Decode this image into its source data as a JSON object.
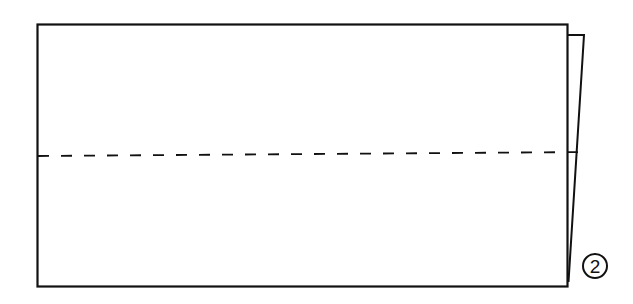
{
  "diagram": {
    "type": "origami-fold-step",
    "step_number": "2",
    "colors": {
      "line": "#111111",
      "background": "#ffffff"
    },
    "paper": {
      "x": 37,
      "y": 24,
      "width": 530,
      "height": 262
    },
    "flap": {
      "top_left": [
        567,
        35
      ],
      "top_right": [
        584,
        35
      ],
      "bottom_point": [
        568,
        282
      ]
    },
    "fold_line": {
      "style": "dashed",
      "start": [
        38,
        156
      ],
      "end": [
        588,
        152
      ]
    }
  }
}
